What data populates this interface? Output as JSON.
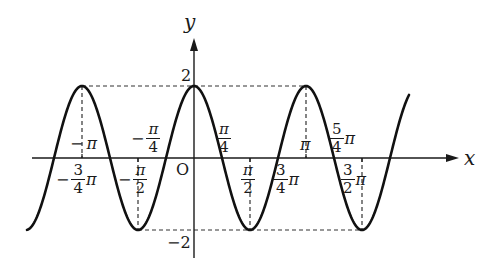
{
  "chart_data": {
    "type": "line",
    "title": "",
    "function": "y = 2cos(2x)",
    "xlabel": "x",
    "ylabel": "y",
    "origin_label": "O",
    "amplitude": 2,
    "period": "π",
    "x_range": [
      "-5π/4 - ε",
      "3π/2 + π/4 + ε"
    ],
    "y_ticks": [
      {
        "value": 2,
        "label": "2"
      },
      {
        "value": -2,
        "label": "-2"
      }
    ],
    "x_tick_labels": [
      {
        "value": "-π",
        "label": "−π"
      },
      {
        "value": "-3π/4",
        "label": "−3/4 π"
      },
      {
        "value": "-π/2",
        "label": "−π/2"
      },
      {
        "value": "-π/4",
        "label": "−π/4"
      },
      {
        "value": "π/4",
        "label": "π/4"
      },
      {
        "value": "π/2",
        "label": "π/2"
      },
      {
        "value": "3π/4",
        "label": "3/4 π"
      },
      {
        "value": "π",
        "label": "π"
      },
      {
        "value": "5π/4",
        "label": "5/4 π"
      },
      {
        "value": "3π/2",
        "label": "3/2 π"
      }
    ],
    "key_points": [
      {
        "x": "-π",
        "y": 2
      },
      {
        "x": "-π/2",
        "y": -2
      },
      {
        "x": "0",
        "y": 2
      },
      {
        "x": "π/2",
        "y": -2
      },
      {
        "x": "π",
        "y": 2
      },
      {
        "x": "3π/2",
        "y": -2
      }
    ],
    "guides": "dashed horizontal lines at y=2 and y=-2; dashed vertical drop lines at extrema",
    "grid": false,
    "legend": null
  },
  "labels": {
    "y_axis": "y",
    "x_axis": "x",
    "origin": "O",
    "y_max": "2",
    "y_min": "−2",
    "neg_pi": {
      "sign": "−",
      "pi": "π"
    },
    "neg_3_4_pi": {
      "sign": "−",
      "num": "3",
      "den": "4",
      "pi": "π"
    },
    "neg_pi_2": {
      "sign": "−",
      "num": "π",
      "den": "2"
    },
    "neg_pi_4": {
      "sign": "−",
      "num": "π",
      "den": "4"
    },
    "pi_4": {
      "num": "π",
      "den": "4"
    },
    "pi_2": {
      "num": "π",
      "den": "2"
    },
    "three_4_pi": {
      "num": "3",
      "den": "4",
      "pi": "π"
    },
    "pi": "π",
    "five_4_pi": {
      "num": "5",
      "den": "4",
      "pi": "π"
    },
    "three_2_pi": {
      "num": "3",
      "den": "2",
      "pi": "π"
    }
  },
  "colors": {
    "stroke": "#1a1a1a",
    "background": "#ffffff"
  }
}
